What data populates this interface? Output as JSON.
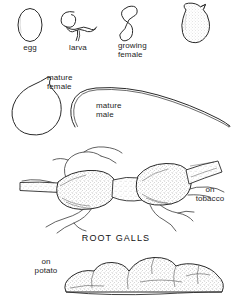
{
  "figure": {
    "title_caption": "ROOT GALLS",
    "background_color": "#ffffff",
    "ink_color": "#1d1d1d"
  },
  "stages": [
    {
      "id": "egg",
      "label": "egg",
      "icon": "nematode-egg-oval"
    },
    {
      "id": "larva",
      "label": "larva",
      "icon": "nematode-larva-coiled-worm"
    },
    {
      "id": "growing-female",
      "label": "growing\nfemale",
      "icon": "nematode-growing-female-s-shape"
    },
    {
      "id": "swollen-female",
      "label": "",
      "icon": "nematode-swollen-female-flask"
    },
    {
      "id": "mature-female",
      "label": "mature\nfemale",
      "icon": "nematode-mature-female-pear"
    },
    {
      "id": "mature-male",
      "label": "mature\nmale",
      "icon": "nematode-mature-male-long-worm"
    }
  ],
  "damage": [
    {
      "id": "tobacco",
      "label": "on\ntobacco",
      "icon": "galled-root-tobacco"
    },
    {
      "id": "potato",
      "label": "on\npotato",
      "icon": "galled-tuber-potato"
    }
  ]
}
